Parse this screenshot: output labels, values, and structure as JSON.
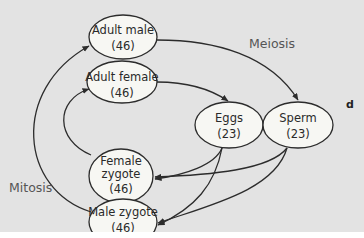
{
  "diagram": {
    "panel_letter": "d",
    "background_color": "#e3e3e3",
    "node_fill": "#f7f7f3",
    "stroke_color": "#2c2c2c",
    "nodes": [
      {
        "id": "adult_male",
        "line1": "Adult male",
        "line2": "(46)"
      },
      {
        "id": "adult_female",
        "line1": "Adult female",
        "line2": "(46)"
      },
      {
        "id": "eggs",
        "line1": "Eggs",
        "line2": "(23)"
      },
      {
        "id": "sperm",
        "line1": "Sperm",
        "line2": "(23)"
      },
      {
        "id": "female_zygote",
        "line1": "Female",
        "line2": "zygote",
        "line3": "(46)"
      },
      {
        "id": "male_zygote",
        "line1": "Male zygote",
        "line2": "(46)"
      }
    ],
    "edge_labels": {
      "meiosis": "Meiosis",
      "mitosis": "Mitosis"
    },
    "edges": [
      {
        "from": "adult_male",
        "to": "sperm",
        "label": "Meiosis"
      },
      {
        "from": "adult_female",
        "to": "eggs"
      },
      {
        "from": "eggs",
        "to": "female_zygote"
      },
      {
        "from": "eggs",
        "to": "male_zygote"
      },
      {
        "from": "sperm",
        "to": "female_zygote"
      },
      {
        "from": "sperm",
        "to": "male_zygote"
      },
      {
        "from": "female_zygote",
        "to": "adult_female"
      },
      {
        "from": "male_zygote",
        "to": "adult_male",
        "label": "Mitosis"
      }
    ]
  }
}
